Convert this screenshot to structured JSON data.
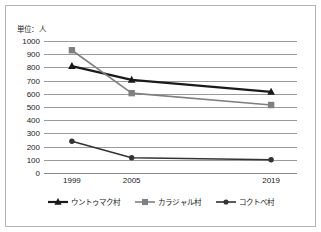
{
  "figure": {
    "unit_note": "単位：人"
  },
  "chart_data": {
    "type": "line",
    "title": "",
    "subtitle": "",
    "annotations": [
      "単位：人"
    ],
    "xlabel": "",
    "ylabel": "",
    "categories": [
      "1999",
      "2005",
      "2019"
    ],
    "x_values": [
      1999,
      2005,
      2019
    ],
    "x_tick_labels": [
      "1999",
      "2005",
      "2019"
    ],
    "ylim": [
      0,
      1000
    ],
    "y_ticks": [
      0,
      100,
      200,
      300,
      400,
      500,
      600,
      700,
      800,
      900,
      1000
    ],
    "y_tick_labels": [
      "0",
      "100",
      "200",
      "300",
      "400",
      "500",
      "600",
      "700",
      "800",
      "900",
      "1000"
    ],
    "grid": "horizontal",
    "legend_position": "bottom",
    "series": [
      {
        "name": "ウントゥマク村",
        "values": [
          810,
          705,
          615
        ],
        "color": "#1a1a1a",
        "marker": "triangle",
        "line_width": 2.2
      },
      {
        "name": "カラジャル村",
        "values": [
          930,
          605,
          515
        ],
        "color": "#808080",
        "marker": "square",
        "line_width": 1.6
      },
      {
        "name": "コクトベ村",
        "values": [
          240,
          115,
          100
        ],
        "color": "#333333",
        "marker": "circle",
        "line_width": 1.6
      }
    ]
  },
  "legend": {
    "items": [
      {
        "label": "ウントゥマク村",
        "color": "#1a1a1a",
        "marker": "triangle"
      },
      {
        "label": "カラジャル村",
        "color": "#808080",
        "marker": "square"
      },
      {
        "label": "コクトベ村",
        "color": "#333333",
        "marker": "circle"
      }
    ]
  }
}
